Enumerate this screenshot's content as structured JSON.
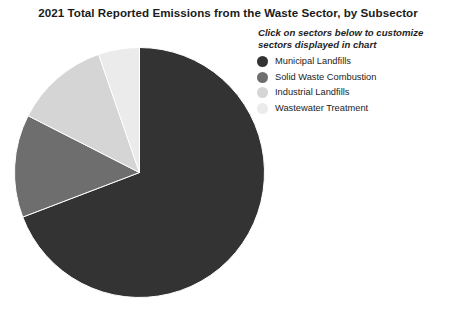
{
  "header": {
    "title": "2021 Total Reported Emissions from the Waste Sector, by Subsector",
    "instruction": "Click on sectors below to customize sectors displayed in chart"
  },
  "legend": {
    "items": [
      {
        "label": "Municipal Landfills",
        "color": "#333333",
        "swatch_icon": "circle-swatch-icon"
      },
      {
        "label": "Solid Waste Combustion",
        "color": "#6e6e6e",
        "swatch_icon": "circle-swatch-icon"
      },
      {
        "label": "Industrial Landfills",
        "color": "#d5d5d5",
        "swatch_icon": "circle-swatch-icon"
      },
      {
        "label": "Wastewater Treatment",
        "color": "#ebebeb",
        "swatch_icon": "circle-swatch-icon"
      }
    ]
  },
  "chart_data": {
    "type": "pie",
    "title": "2021 Total Reported Emissions from the Waste Sector, by Subsector",
    "subtitle": "Click on sectors below to customize sectors displayed in chart",
    "xlabel": "",
    "ylabel": "",
    "legend_position": "right",
    "grid": false,
    "start_angle_deg": 0,
    "direction": "clockwise",
    "categories": [
      "Municipal Landfills",
      "Solid Waste Combustion",
      "Industrial Landfills",
      "Wastewater Treatment"
    ],
    "values": [
      69.2,
      13.3,
      12.2,
      5.3
    ],
    "value_unit": "percent",
    "colors": [
      "#333333",
      "#6e6e6e",
      "#d5d5d5",
      "#ebebeb"
    ],
    "series": [
      {
        "name": "Share of reported waste sector emissions",
        "values": [
          69.2,
          13.3,
          12.2,
          5.3
        ]
      }
    ],
    "slice_angles_deg": [
      {
        "category": "Municipal Landfills",
        "start": 0,
        "end": 249.1
      },
      {
        "category": "Solid Waste Combustion",
        "start": 249.1,
        "end": 297.0
      },
      {
        "category": "Industrial Landfills",
        "start": 297.0,
        "end": 340.9
      },
      {
        "category": "Wastewater Treatment",
        "start": 340.9,
        "end": 360
      }
    ]
  }
}
